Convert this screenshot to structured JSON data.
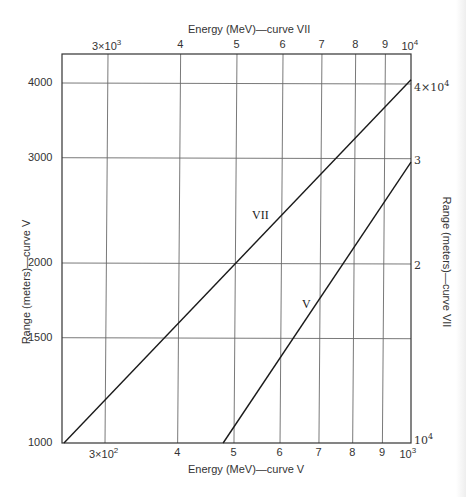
{
  "chart_data": {
    "type": "line",
    "title": "",
    "scale": "log-log",
    "grid": true,
    "axes": {
      "x_bottom": {
        "label": "Energy (MeV)—curve V",
        "range": [
          250,
          1000
        ],
        "ticks": [
          {
            "value": 300,
            "label": "3×10",
            "sup": "2"
          },
          {
            "value": 400,
            "label": "4",
            "sup": ""
          },
          {
            "value": 500,
            "label": "5",
            "sup": ""
          },
          {
            "value": 600,
            "label": "6",
            "sup": ""
          },
          {
            "value": 700,
            "label": "7",
            "sup": ""
          },
          {
            "value": 800,
            "label": "8",
            "sup": ""
          },
          {
            "value": 900,
            "label": "9",
            "sup": ""
          },
          {
            "value": 1000,
            "label": "10",
            "sup": "3"
          }
        ]
      },
      "x_top": {
        "label": "Energy (MeV)—curve VII",
        "range": [
          2500,
          10000
        ],
        "ticks": [
          {
            "value": 3000,
            "label": "3×10",
            "sup": "3"
          },
          {
            "value": 4000,
            "label": "4",
            "sup": ""
          },
          {
            "value": 5000,
            "label": "5",
            "sup": ""
          },
          {
            "value": 6000,
            "label": "6",
            "sup": ""
          },
          {
            "value": 7000,
            "label": "7",
            "sup": ""
          },
          {
            "value": 8000,
            "label": "8",
            "sup": ""
          },
          {
            "value": 9000,
            "label": "9",
            "sup": ""
          },
          {
            "value": 10000,
            "label": "10",
            "sup": "4"
          }
        ]
      },
      "y_left": {
        "label": "Range (meters)—curve V",
        "range": [
          1000,
          4500
        ],
        "ticks": [
          {
            "value": 1000,
            "label": "1000"
          },
          {
            "value": 1500,
            "label": "1500"
          },
          {
            "value": 2000,
            "label": "2000"
          },
          {
            "value": 3000,
            "label": "3000"
          },
          {
            "value": 4000,
            "label": "4000"
          }
        ]
      },
      "y_right": {
        "label": "Range (meters)—curve VII",
        "range": [
          10000,
          45000
        ],
        "ticks": [
          {
            "value": 10000,
            "label": "10",
            "sup": "4"
          },
          {
            "value": 20000,
            "label": "2",
            "sup": ""
          },
          {
            "value": 30000,
            "label": "3",
            "sup": ""
          },
          {
            "value": 40000,
            "label": "4×10",
            "sup": "4"
          }
        ]
      }
    },
    "series": [
      {
        "name": "V",
        "x_axis": "x_bottom",
        "y_axis": "y_left",
        "points": [
          [
            479,
            1000
          ],
          [
            600,
            1430
          ],
          [
            700,
            1840
          ],
          [
            800,
            2290
          ],
          [
            900,
            2620
          ],
          [
            1000,
            2950
          ]
        ]
      },
      {
        "name": "VII",
        "x_axis": "x_top",
        "y_axis": "y_right",
        "points": [
          [
            2550,
            10000
          ],
          [
            3000,
            12600
          ],
          [
            4000,
            18000
          ],
          [
            5000,
            23300
          ],
          [
            6000,
            28500
          ],
          [
            7000,
            32000
          ],
          [
            8000,
            35000
          ],
          [
            10000,
            40500
          ]
        ]
      }
    ],
    "legend": "inline curve labels (V, VII)"
  },
  "labels": {
    "top_title": "Energy (MeV)—curve VII",
    "bottom_title": "Energy (MeV)—curve V",
    "left_title": "Range (meters)—curve V",
    "right_title": "Range (meters)—curve VII",
    "curve_v": "V",
    "curve_vii": "VII"
  },
  "colors": {
    "line": "#1a1a1a",
    "grid": "#555555",
    "text": "#333333",
    "background": "#ffffff"
  }
}
